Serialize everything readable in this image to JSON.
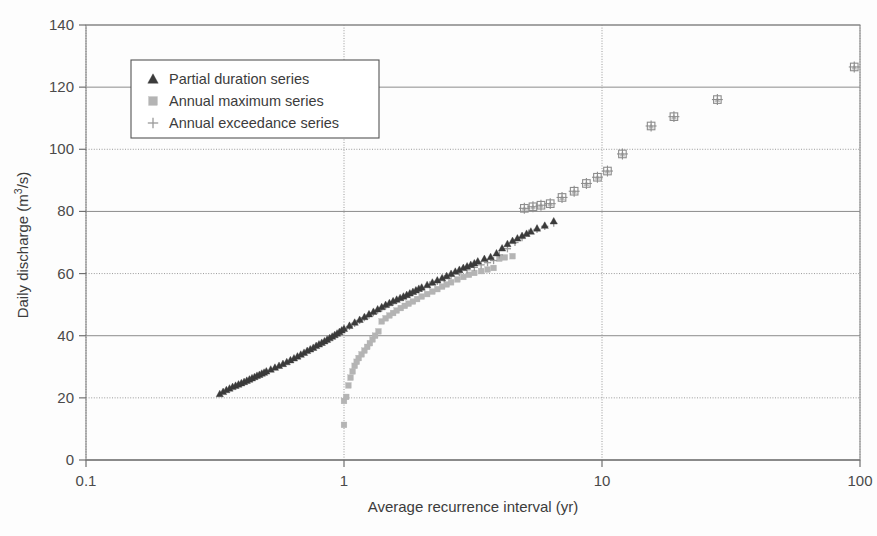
{
  "chart_data": {
    "type": "scatter",
    "title": "",
    "xlabel": "Average recurrence interval (yr)",
    "ylabel": "Daily discharge (m3/s)",
    "ylabel_base": "Daily discharge (m",
    "ylabel_sup": "3",
    "ylabel_tail": "/s)",
    "xscale": "log",
    "yscale": "linear",
    "xlim": [
      0.1,
      100
    ],
    "ylim": [
      0,
      140
    ],
    "xticks": [
      "0.1",
      "1",
      "10",
      "100"
    ],
    "xtick_values": [
      0.1,
      1,
      10,
      100
    ],
    "yticks": [
      "0",
      "20",
      "40",
      "60",
      "80",
      "100",
      "120",
      "140"
    ],
    "ytick_values": [
      0,
      20,
      40,
      60,
      80,
      100,
      120,
      140
    ],
    "grid": "both",
    "legend_position": "upper left inside",
    "series": [
      {
        "name": "Partial duration series",
        "marker": "triangle",
        "color": "#3b3b3b",
        "points": [
          [
            0.33,
            21.3
          ],
          [
            0.34,
            22.0
          ],
          [
            0.35,
            22.6
          ],
          [
            0.36,
            23.1
          ],
          [
            0.37,
            23.6
          ],
          [
            0.38,
            24.0
          ],
          [
            0.39,
            24.4
          ],
          [
            0.4,
            24.8
          ],
          [
            0.41,
            25.2
          ],
          [
            0.42,
            25.6
          ],
          [
            0.43,
            26.0
          ],
          [
            0.44,
            26.4
          ],
          [
            0.45,
            26.8
          ],
          [
            0.46,
            27.2
          ],
          [
            0.47,
            27.5
          ],
          [
            0.48,
            27.9
          ],
          [
            0.49,
            28.2
          ],
          [
            0.5,
            28.6
          ],
          [
            0.52,
            29.2
          ],
          [
            0.54,
            29.8
          ],
          [
            0.56,
            30.4
          ],
          [
            0.58,
            31.0
          ],
          [
            0.6,
            31.6
          ],
          [
            0.62,
            32.2
          ],
          [
            0.64,
            32.8
          ],
          [
            0.66,
            33.4
          ],
          [
            0.68,
            34.0
          ],
          [
            0.7,
            34.6
          ],
          [
            0.72,
            35.2
          ],
          [
            0.74,
            35.7
          ],
          [
            0.76,
            36.2
          ],
          [
            0.78,
            36.8
          ],
          [
            0.8,
            37.3
          ],
          [
            0.82,
            37.8
          ],
          [
            0.84,
            38.3
          ],
          [
            0.86,
            38.8
          ],
          [
            0.88,
            39.3
          ],
          [
            0.9,
            39.8
          ],
          [
            0.92,
            40.3
          ],
          [
            0.94,
            40.8
          ],
          [
            0.96,
            41.3
          ],
          [
            0.98,
            41.8
          ],
          [
            1.0,
            42.3
          ],
          [
            1.05,
            43.3
          ],
          [
            1.1,
            44.3
          ],
          [
            1.15,
            45.2
          ],
          [
            1.2,
            46.1
          ],
          [
            1.25,
            47.0
          ],
          [
            1.3,
            47.8
          ],
          [
            1.35,
            48.6
          ],
          [
            1.4,
            49.3
          ],
          [
            1.45,
            50.0
          ],
          [
            1.5,
            50.6
          ],
          [
            1.55,
            51.2
          ],
          [
            1.6,
            51.7
          ],
          [
            1.65,
            52.2
          ],
          [
            1.7,
            52.7
          ],
          [
            1.75,
            53.2
          ],
          [
            1.8,
            53.7
          ],
          [
            1.85,
            54.2
          ],
          [
            1.9,
            54.7
          ],
          [
            1.95,
            55.2
          ],
          [
            2.0,
            55.6
          ],
          [
            2.1,
            56.4
          ],
          [
            2.2,
            57.2
          ],
          [
            2.3,
            57.9
          ],
          [
            2.4,
            58.6
          ],
          [
            2.5,
            59.3
          ],
          [
            2.6,
            60.0
          ],
          [
            2.7,
            60.7
          ],
          [
            2.8,
            61.3
          ],
          [
            2.9,
            61.9
          ],
          [
            3.0,
            62.4
          ],
          [
            3.1,
            62.9
          ],
          [
            3.2,
            63.4
          ],
          [
            3.3,
            64.0
          ],
          [
            3.5,
            64.8
          ],
          [
            3.7,
            65.4
          ],
          [
            3.9,
            66.6
          ],
          [
            4.1,
            68.2
          ],
          [
            4.3,
            69.6
          ],
          [
            4.5,
            70.6
          ],
          [
            4.7,
            71.4
          ],
          [
            4.9,
            72.2
          ],
          [
            5.1,
            72.9
          ],
          [
            5.3,
            73.6
          ],
          [
            5.6,
            74.6
          ],
          [
            6.0,
            75.5
          ],
          [
            6.5,
            76.9
          ]
        ]
      },
      {
        "name": "Annual maximum series",
        "marker": "square",
        "color": "#b4b4b4",
        "points": [
          [
            1.0,
            11.3
          ],
          [
            1.0,
            19.0
          ],
          [
            1.02,
            20.3
          ],
          [
            1.04,
            24.0
          ],
          [
            1.06,
            26.5
          ],
          [
            1.08,
            28.5
          ],
          [
            1.1,
            30.3
          ],
          [
            1.12,
            31.6
          ],
          [
            1.14,
            32.8
          ],
          [
            1.17,
            34.0
          ],
          [
            1.2,
            35.2
          ],
          [
            1.23,
            36.4
          ],
          [
            1.26,
            37.6
          ],
          [
            1.29,
            38.8
          ],
          [
            1.32,
            40.0
          ],
          [
            1.36,
            41.4
          ],
          [
            1.4,
            44.6
          ],
          [
            1.45,
            45.6
          ],
          [
            1.5,
            46.5
          ],
          [
            1.55,
            47.3
          ],
          [
            1.6,
            48.1
          ],
          [
            1.66,
            48.9
          ],
          [
            1.72,
            49.6
          ],
          [
            1.78,
            50.3
          ],
          [
            1.85,
            51.0
          ],
          [
            1.92,
            51.8
          ],
          [
            2.0,
            52.6
          ],
          [
            2.1,
            53.4
          ],
          [
            2.2,
            54.2
          ],
          [
            2.3,
            55.0
          ],
          [
            2.4,
            55.8
          ],
          [
            2.5,
            56.5
          ],
          [
            2.6,
            57.2
          ],
          [
            2.75,
            58.1
          ],
          [
            2.9,
            58.9
          ],
          [
            3.05,
            59.6
          ],
          [
            3.2,
            60.2
          ],
          [
            3.4,
            60.8
          ],
          [
            3.6,
            61.3
          ],
          [
            3.8,
            61.8
          ],
          [
            4.0,
            64.8
          ],
          [
            4.2,
            65.2
          ],
          [
            4.5,
            65.6
          ]
        ]
      },
      {
        "name": "Annual exceedance series",
        "marker": "plus",
        "color": "#9a9a9a",
        "points": [
          [
            1.0,
            42.0
          ],
          [
            1.05,
            43.0
          ],
          [
            1.1,
            44.0
          ],
          [
            1.15,
            44.9
          ],
          [
            1.2,
            45.8
          ],
          [
            1.25,
            46.6
          ],
          [
            1.3,
            47.4
          ],
          [
            1.35,
            48.2
          ],
          [
            1.4,
            48.9
          ],
          [
            1.45,
            49.6
          ],
          [
            1.5,
            50.2
          ],
          [
            1.55,
            50.8
          ],
          [
            1.6,
            51.4
          ],
          [
            1.7,
            52.4
          ],
          [
            1.8,
            53.4
          ],
          [
            1.9,
            54.4
          ],
          [
            2.0,
            55.3
          ],
          [
            2.15,
            56.4
          ],
          [
            2.3,
            57.5
          ],
          [
            2.45,
            58.4
          ],
          [
            2.6,
            59.3
          ],
          [
            2.8,
            60.3
          ],
          [
            3.0,
            61.2
          ],
          [
            3.2,
            62.0
          ],
          [
            3.4,
            62.8
          ],
          [
            3.6,
            63.5
          ],
          [
            3.8,
            64.2
          ],
          [
            4.0,
            66.0
          ],
          [
            4.3,
            68.0
          ],
          [
            4.6,
            70.0
          ],
          [
            4.9,
            71.6
          ],
          [
            5.2,
            73.0
          ],
          [
            5.6,
            74.2
          ],
          [
            6.0,
            75.2
          ],
          [
            6.5,
            76.2
          ]
        ]
      },
      {
        "name": "Upper tail combined points",
        "marker": "combined",
        "color": "#8d8d8d",
        "points": [
          [
            5.0,
            81.0
          ],
          [
            5.4,
            81.5
          ],
          [
            5.8,
            82.0
          ],
          [
            6.3,
            82.5
          ],
          [
            7.0,
            84.5
          ],
          [
            7.8,
            86.5
          ],
          [
            8.7,
            89.0
          ],
          [
            9.6,
            91.0
          ],
          [
            10.5,
            93.0
          ],
          [
            12.0,
            98.5
          ],
          [
            15.5,
            107.5
          ],
          [
            19.0,
            110.5
          ],
          [
            28.0,
            116.0
          ],
          [
            95.0,
            126.5
          ]
        ]
      }
    ]
  },
  "legend": {
    "items": [
      {
        "label": "Partial duration series",
        "marker": "triangle"
      },
      {
        "label": "Annual maximum series",
        "marker": "square"
      },
      {
        "label": "Annual exceedance series",
        "marker": "plus"
      }
    ]
  },
  "colors": {
    "partial_duration": "#3b3b3b",
    "annual_maximum": "#b4b4b4",
    "annual_exceedance": "#9a9a9a",
    "grid": "#9a9a9a",
    "frame": "#8a8a8a",
    "background": "#fdfdfd",
    "text": "#3c3c3c"
  }
}
